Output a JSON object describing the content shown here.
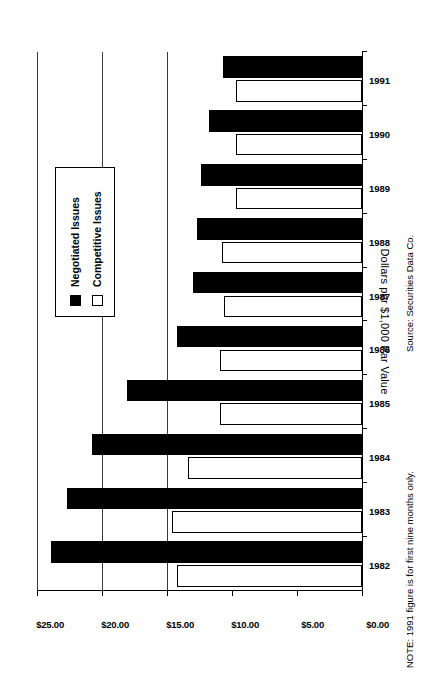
{
  "chart_data": {
    "type": "bar",
    "title": "",
    "subtitle": "",
    "orientation": "vertical-rotated-90ccw",
    "xlabel": "",
    "ylabel": "Dollars per $1,000 Par Value",
    "categories": [
      "1982",
      "1983",
      "1984",
      "1985",
      "1986",
      "1987",
      "1988",
      "1989",
      "1990",
      "1991"
    ],
    "series": [
      {
        "name": "Negotiated Issues",
        "color": "#000000",
        "values": [
          23.9,
          22.7,
          20.8,
          18.1,
          14.2,
          13.0,
          12.7,
          12.4,
          11.8,
          10.7
        ]
      },
      {
        "name": "Competitive Issues",
        "color": "#ffffff",
        "values": [
          14.2,
          14.6,
          13.4,
          10.9,
          10.9,
          10.6,
          10.8,
          9.7,
          9.7,
          9.7
        ]
      }
    ],
    "ylim": [
      0,
      25
    ],
    "ytick_values": [
      0,
      5,
      10,
      15,
      20,
      25
    ],
    "ytick_labels": [
      "$0.00",
      "$5.00",
      "$10.00",
      "$15.00",
      "$20.00",
      "$25.00"
    ],
    "grid": true,
    "gridlines_at": [
      15,
      20,
      25
    ],
    "legend_position": "upper-right",
    "annotations": [
      "Source: Securities Data Co.",
      "NOTE: 1991 figure is for first nine months only."
    ]
  },
  "axis": {
    "y_title": "Dollars per $1,000 Par Value",
    "ticks": [
      {
        "label": "$25.00",
        "value": 25
      },
      {
        "label": "$20.00",
        "value": 20
      },
      {
        "label": "$15.00",
        "value": 15
      },
      {
        "label": "$10.00",
        "value": 10
      },
      {
        "label": "$5.00",
        "value": 5
      },
      {
        "label": "$0.00",
        "value": 0
      }
    ]
  },
  "legend": {
    "items": [
      {
        "label": "Negotiated Issues",
        "swatch": "filled"
      },
      {
        "label": "Competitive Issues",
        "swatch": "hollow"
      }
    ]
  },
  "categories": [
    {
      "label": "1982"
    },
    {
      "label": "1983"
    },
    {
      "label": "1984"
    },
    {
      "label": "1985"
    },
    {
      "label": "1986"
    },
    {
      "label": "1987"
    },
    {
      "label": "1988"
    },
    {
      "label": "1989"
    },
    {
      "label": "1990"
    },
    {
      "label": "1991"
    }
  ],
  "notes": {
    "source": "Source: Securities Data Co.",
    "footnote": "NOTE: 1991 figure is for first nine months only."
  }
}
